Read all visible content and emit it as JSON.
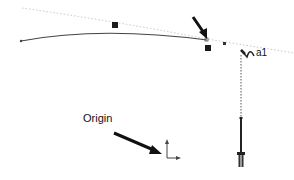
{
  "diagram": {
    "labels": {
      "origin": "Origin",
      "cursor_text": "a1"
    },
    "elements": [
      {
        "id": "bezier-curve",
        "type": "curve"
      },
      {
        "id": "tangent-guide",
        "type": "dotted-line"
      },
      {
        "id": "control-handle-1",
        "type": "square-handle"
      },
      {
        "id": "control-handle-2",
        "type": "square-handle"
      },
      {
        "id": "pointer-arrow",
        "type": "arrow"
      },
      {
        "id": "pen-cursor",
        "type": "cursor"
      },
      {
        "id": "vertical-projection",
        "type": "dotted-line"
      },
      {
        "id": "stylus-tool",
        "type": "tool"
      },
      {
        "id": "origin-axes",
        "type": "axes"
      }
    ],
    "colors": {
      "stroke": "#333333",
      "guide": "#bbbbbb",
      "handle": "#1a1a1a"
    }
  }
}
